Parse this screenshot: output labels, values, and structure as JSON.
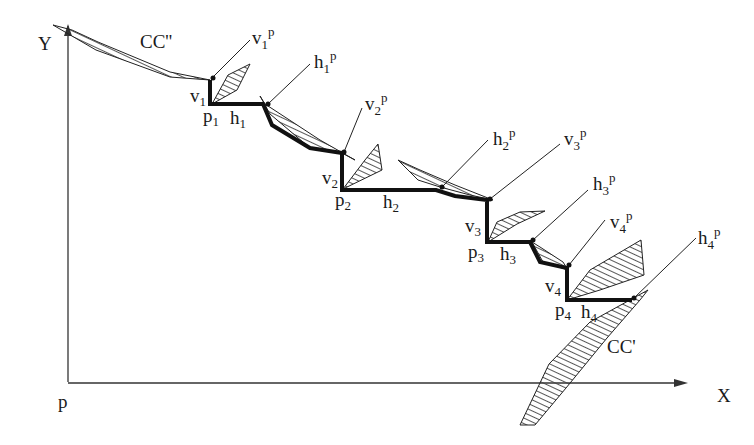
{
  "axes": {
    "y_label": "Y",
    "x_label": "X",
    "origin_label": "p"
  },
  "curves": {
    "upper": "CC''",
    "lower": "CC'"
  },
  "points": [
    {
      "p": "p",
      "p_sub": "1",
      "v": "v",
      "v_sub": "1",
      "h": "h",
      "h_sub": "1"
    },
    {
      "p": "p",
      "p_sub": "2",
      "v": "v",
      "v_sub": "2",
      "h": "h",
      "h_sub": "2"
    },
    {
      "p": "p",
      "p_sub": "3",
      "v": "v",
      "v_sub": "3",
      "h": "h",
      "h_sub": "3"
    },
    {
      "p": "p",
      "p_sub": "4",
      "v": "v",
      "v_sub": "4",
      "h": "h",
      "h_sub": "4"
    }
  ],
  "callouts": [
    {
      "base": "v",
      "sub": "1",
      "sup": "p"
    },
    {
      "base": "h",
      "sub": "1",
      "sup": "p"
    },
    {
      "base": "v",
      "sub": "2",
      "sup": "p"
    },
    {
      "base": "h",
      "sub": "2",
      "sup": "p"
    },
    {
      "base": "v",
      "sub": "3",
      "sup": "p"
    },
    {
      "base": "h",
      "sub": "3",
      "sup": "p"
    },
    {
      "base": "v",
      "sub": "4",
      "sup": "p"
    },
    {
      "base": "h",
      "sub": "4",
      "sup": "p"
    }
  ],
  "colors": {
    "ink": "#111111",
    "background": "#ffffff"
  }
}
